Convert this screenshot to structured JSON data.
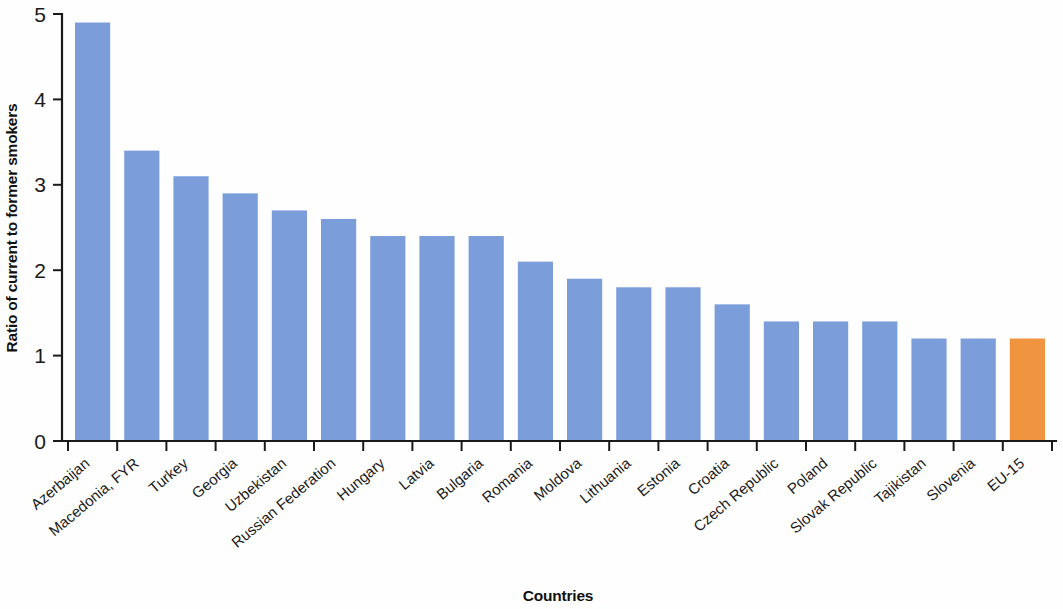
{
  "chart_data": {
    "type": "bar",
    "title": "",
    "xlabel": "Countries",
    "ylabel": "Ratio of current to former smokers",
    "ylim": [
      0,
      5
    ],
    "ytick_labels": [
      "0",
      "1",
      "2",
      "3",
      "4",
      "5"
    ],
    "ytick_values": [
      0,
      1,
      2,
      3,
      4,
      5
    ],
    "grid": false,
    "legend": "none",
    "categories": [
      "Azerbaijan",
      "Macedonia, FYR",
      "Turkey",
      "Georgia",
      "Uzbekistan",
      "Russian Federation",
      "Hungary",
      "Latvia",
      "Bulgaria",
      "Romania",
      "Moldova",
      "Lithuania",
      "Estonia",
      "Croatia",
      "Czech Republic",
      "Poland",
      "Slovak Republic",
      "Tajikistan",
      "Slovenia",
      "EU-15"
    ],
    "values": [
      4.9,
      3.4,
      3.1,
      2.9,
      2.7,
      2.6,
      2.4,
      2.4,
      2.4,
      2.1,
      1.9,
      1.8,
      1.8,
      1.6,
      1.4,
      1.4,
      1.4,
      1.2,
      1.2,
      1.2
    ],
    "bar_colors": [
      "#7b9dda",
      "#7b9dda",
      "#7b9dda",
      "#7b9dda",
      "#7b9dda",
      "#7b9dda",
      "#7b9dda",
      "#7b9dda",
      "#7b9dda",
      "#7b9dda",
      "#7b9dda",
      "#7b9dda",
      "#7b9dda",
      "#7b9dda",
      "#7b9dda",
      "#7b9dda",
      "#7b9dda",
      "#7b9dda",
      "#7b9dda",
      "#f0953f"
    ],
    "colors": {
      "series_default": "#7b9dda",
      "highlight": "#f0953f",
      "axis": "#1a1a1a",
      "background": "#ffffff"
    }
  }
}
